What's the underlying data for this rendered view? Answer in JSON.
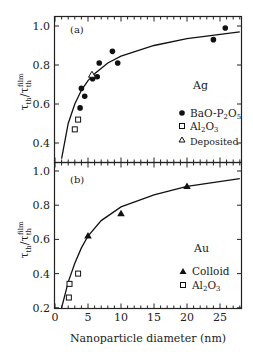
{
  "chart_data": [
    {
      "type": "scatter",
      "panel": "(a)",
      "material": "Ag",
      "xlabel": "Nanoparticle diameter (nm)",
      "ylabel": "τth/τth^film",
      "xlim": [
        0,
        28
      ],
      "ylim": [
        0.32,
        1.05
      ],
      "yticks": [
        "0.4",
        "0.6",
        "0.8",
        "1.0"
      ],
      "series": [
        {
          "name": "BaO-P2O5",
          "marker": "filled-circle",
          "points": [
            [
              3.8,
              0.58
            ],
            [
              4.0,
              0.68
            ],
            [
              4.5,
              0.64
            ],
            [
              5.7,
              0.73
            ],
            [
              6.4,
              0.74
            ],
            [
              6.7,
              0.81
            ],
            [
              8.7,
              0.87
            ],
            [
              9.5,
              0.81
            ],
            [
              24.0,
              0.93
            ],
            [
              25.8,
              0.99
            ]
          ]
        },
        {
          "name": "Al2O3",
          "marker": "open-square",
          "points": [
            [
              3.0,
              0.47
            ],
            [
              3.5,
              0.52
            ]
          ]
        },
        {
          "name": "Deposited",
          "marker": "open-triangle",
          "points": [
            [
              5.6,
              0.75
            ]
          ]
        },
        {
          "name": "fit",
          "marker": "line",
          "points": [
            [
              1.0,
              0.32
            ],
            [
              2,
              0.5
            ],
            [
              3,
              0.6
            ],
            [
              4,
              0.67
            ],
            [
              5,
              0.72
            ],
            [
              6,
              0.755
            ],
            [
              8,
              0.81
            ],
            [
              10,
              0.845
            ],
            [
              15,
              0.9
            ],
            [
              20,
              0.935
            ],
            [
              28,
              0.97
            ]
          ]
        }
      ]
    },
    {
      "type": "scatter",
      "panel": "(b)",
      "material": "Au",
      "xlabel": "Nanoparticle diameter (nm)",
      "ylabel": "τth/τth^film",
      "xlim": [
        0,
        28
      ],
      "ylim": [
        0.2,
        1.05
      ],
      "xticks": [
        "0",
        "5",
        "10",
        "15",
        "20",
        "25"
      ],
      "yticks": [
        "0.2",
        "0.4",
        "0.6",
        "0.8",
        "1.0"
      ],
      "series": [
        {
          "name": "Colloid",
          "marker": "filled-triangle",
          "points": [
            [
              5,
              0.62
            ],
            [
              10,
              0.75
            ],
            [
              20,
              0.91
            ]
          ]
        },
        {
          "name": "Al2O3",
          "marker": "open-square",
          "points": [
            [
              2.1,
              0.26
            ],
            [
              2.2,
              0.34
            ],
            [
              3.5,
              0.4
            ]
          ]
        },
        {
          "name": "fit",
          "marker": "line",
          "points": [
            [
              1.0,
              0.2
            ],
            [
              2,
              0.35
            ],
            [
              3,
              0.46
            ],
            [
              4,
              0.55
            ],
            [
              5,
              0.62
            ],
            [
              7,
              0.71
            ],
            [
              10,
              0.79
            ],
            [
              15,
              0.86
            ],
            [
              20,
              0.91
            ],
            [
              28,
              0.955
            ]
          ]
        }
      ]
    }
  ],
  "labels": {
    "panel_a": "(a)",
    "panel_b": "(b)",
    "material_a": "Ag",
    "material_b": "Au",
    "xlabel": "Nanoparticle diameter (nm)",
    "legend_a": [
      "BaO-P2O5",
      "Al2O3",
      "Deposited"
    ],
    "legend_b": [
      "Colloid",
      "Al2O3"
    ]
  }
}
